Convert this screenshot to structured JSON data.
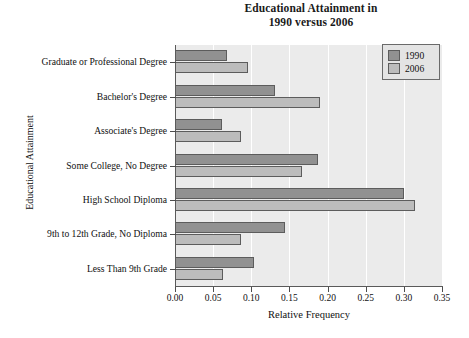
{
  "chart_data": {
    "type": "bar",
    "orientation": "horizontal",
    "title": "Educational Attainment in 1990 versus 2006",
    "title_lines": [
      "Educational Attainment in",
      "1990 versus 2006"
    ],
    "xlabel": "Relative Frequency",
    "ylabel": "Educational Attainment",
    "xlim": [
      0.0,
      0.35
    ],
    "grid": true,
    "grid_axis": "x",
    "legend_position": "top-right",
    "categories": [
      "Less Than 9th Grade",
      "9th to 12th Grade, No Diploma",
      "High School Diploma",
      "Some College, No Degree",
      "Associate's Degree",
      "Bachelor's Degree",
      "Graduate or Professional Degree"
    ],
    "xticks": [
      "0.00",
      "0.05",
      "0.10",
      "0.15",
      "0.20",
      "0.25",
      "0.30",
      "0.35"
    ],
    "xtick_values": [
      0.0,
      0.05,
      0.1,
      0.15,
      0.2,
      0.25,
      0.3,
      0.35
    ],
    "series": [
      {
        "name": "1990",
        "color": "#919191",
        "values": [
          0.103,
          0.144,
          0.3,
          0.188,
          0.062,
          0.131,
          0.068
        ]
      },
      {
        "name": "2006",
        "color": "#bcbcbc",
        "values": [
          0.063,
          0.087,
          0.315,
          0.167,
          0.087,
          0.19,
          0.096
        ]
      }
    ]
  },
  "legend": {
    "items": [
      {
        "label": "1990",
        "color": "#919191"
      },
      {
        "label": "2006",
        "color": "#bcbcbc"
      }
    ]
  },
  "colors": {
    "series_1990": "#919191",
    "series_2006": "#bcbcbc",
    "plot_background": "#ebebeb",
    "gridline": "#ffffff",
    "axis": "#5a5a5a",
    "page_background": "#ffffff"
  }
}
